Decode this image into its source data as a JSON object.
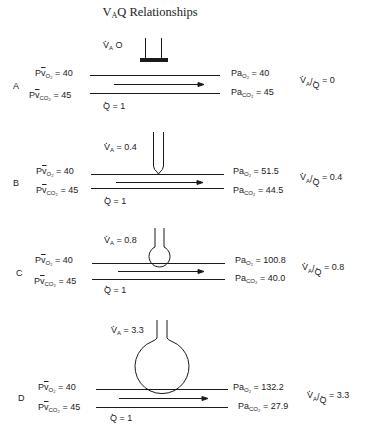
{
  "title": {
    "main": "V",
    "sub": "A",
    "rest": "Q Relationships"
  },
  "panels": [
    {
      "letter": "A",
      "va": "V̇A = O",
      "va_value": "O",
      "pv_o2_label": "P̅v O2",
      "pv_o2": "= 40",
      "pv_co2_label": "P̅v CO2",
      "pv_co2": "= 45",
      "pa_o2_label": "PaO2",
      "pa_o2": "= 40",
      "pa_co2_label": "PaCO2",
      "pa_co2": "= 45",
      "q": "= 1",
      "ratio": "= 0",
      "alveolus": "blocked"
    },
    {
      "letter": "B",
      "va_value": "= 0.4",
      "pv_o2": "= 40",
      "pv_co2": "= 45",
      "pa_o2": "= 51.5",
      "pa_co2": "= 44.5",
      "q": "= 1",
      "ratio": "= 0.4",
      "alveolus": "narrow"
    },
    {
      "letter": "C",
      "va_value": "= 0.8",
      "pv_o2": "= 40",
      "pv_co2": "= 45",
      "pa_o2": "= 100.8",
      "pa_co2": "= 40.0",
      "q": "= 1",
      "ratio": "= 0.8",
      "alveolus": "small bulb"
    },
    {
      "letter": "D",
      "va_value": "= 3.3",
      "pv_o2": "= 40",
      "pv_co2": "= 45",
      "pa_o2": "= 132.2",
      "pa_co2": "= 27.9",
      "q": "= 1",
      "ratio": "= 3.3",
      "alveolus": "large sphere"
    }
  ],
  "symbols": {
    "pv": "P",
    "v": "v",
    "pa": "Pa",
    "o2": "O₂",
    "co2": "CO₂",
    "va_v": "V",
    "va_sub": "A",
    "q": "Q",
    "slash": "/"
  },
  "colors": {
    "ink": "#1a1a1a",
    "background": "#ffffff"
  }
}
